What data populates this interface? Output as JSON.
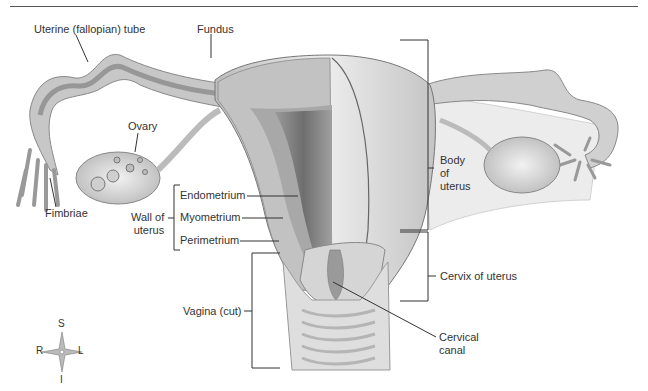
{
  "diagram": {
    "labels": {
      "uterine_tube": "Uterine (fallopian) tube",
      "fundus": "Fundus",
      "ovary": "Ovary",
      "fimbriae": "Fimbriae",
      "endometrium": "Endometrium",
      "myometrium": "Myometrium",
      "perimetrium": "Perimetrium",
      "wall_of_uterus_line1": "Wall of",
      "wall_of_uterus_line2": "uterus",
      "body_of_uterus_line1": "Body",
      "body_of_uterus_line2": "of",
      "body_of_uterus_line3": "uterus",
      "cervix_of_uterus": "Cervix of uterus",
      "vagina": "Vagina (cut)",
      "cervical_canal_line1": "Cervical",
      "cervical_canal_line2": "canal"
    },
    "compass": {
      "superior": "S",
      "inferior": "I",
      "right": "R",
      "left": "L"
    },
    "colors": {
      "tissue_light": "#d9d9d9",
      "tissue_mid": "#b3b3b3",
      "tissue_dark": "#8a8a8a",
      "leader_line": "#333333"
    }
  }
}
